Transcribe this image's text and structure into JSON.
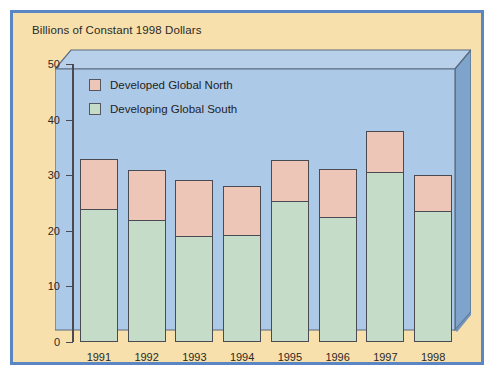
{
  "figure": {
    "border_color": "#5b86c4",
    "background_color": "#f7e0ab",
    "plot_background_color": "#adc9e8",
    "side_panel_color": "#7fa4cc"
  },
  "chart_data": {
    "type": "bar",
    "stacked": true,
    "title": "Billions of Constant 1998 Dollars",
    "xlabel": "",
    "ylabel": "",
    "ylim": [
      0,
      50
    ],
    "yticks": [
      0,
      10,
      20,
      30,
      40,
      50
    ],
    "ytick_labels": [
      "0",
      "10",
      "20",
      "30",
      "40",
      "50"
    ],
    "categories": [
      "1991",
      "1992",
      "1993",
      "1994",
      "1995",
      "1996",
      "1997",
      "1998"
    ],
    "grid": false,
    "legend_position": "upper-left-inside",
    "series": [
      {
        "name": "Developing Global South",
        "color": "#c5ddc8",
        "values": [
          24.0,
          22.0,
          19.0,
          19.3,
          25.3,
          22.5,
          30.5,
          23.6
        ]
      },
      {
        "name": "Developed Global North",
        "color": "#edc6b8",
        "values": [
          9.0,
          9.0,
          10.2,
          8.7,
          7.5,
          8.6,
          7.5,
          6.5
        ]
      }
    ],
    "totals": [
      33.0,
      31.0,
      29.2,
      28.0,
      32.8,
      31.1,
      38.0,
      30.1
    ]
  },
  "legend": {
    "items": [
      {
        "label": "Developed Global North",
        "color": "#edc6b8",
        "key": "north"
      },
      {
        "label": "Developing Global South",
        "color": "#c5ddc8",
        "key": "south"
      }
    ]
  }
}
